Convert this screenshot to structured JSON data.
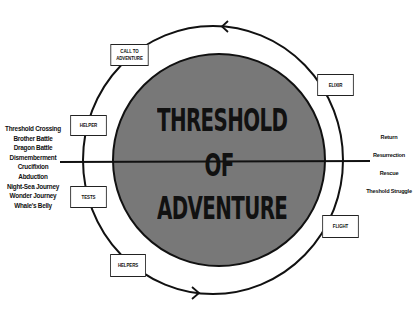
{
  "diagram": {
    "title_lines": [
      "THRESHOLD",
      "OF",
      "ADVENTURE"
    ],
    "stages": {
      "call_to_adventure": [
        "CALL TO",
        "ADVENTURE"
      ],
      "helper": "HELPER",
      "tests": "TESTS",
      "helpers": "HELPERS",
      "flight": "FLIGHT",
      "elixir": "ELIXIR"
    },
    "left_list": [
      "Threshold Crossing",
      "Brother Battle",
      "Dragon Battle",
      "Dismemberment",
      "Crucifixion",
      "Abduction",
      "Night-Sea Journey",
      "Wonder Journey",
      "Whale's Belly"
    ],
    "right_list": [
      "Return",
      "Resurrection",
      "Rescue",
      "Theshold Struggle"
    ],
    "colors": {
      "inner_circle_fill": "#787878",
      "stroke": "#111111",
      "background": "#ffffff"
    },
    "arrows": {
      "top": "arrow-left",
      "bottom": "arrow-right"
    }
  }
}
